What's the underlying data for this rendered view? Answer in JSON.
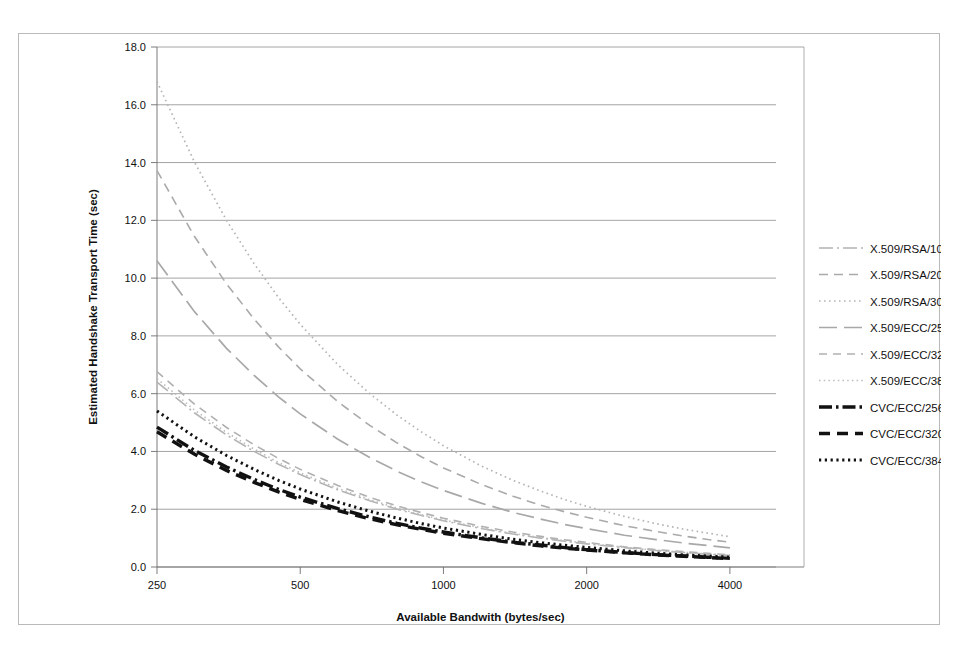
{
  "figure": {
    "background": "#ffffff",
    "border_color": "#b9b9b9"
  },
  "chart_data": {
    "type": "line",
    "title": "",
    "xlabel": "Available Bandwith (bytes/sec)",
    "ylabel": "Estimated Handshake Transport Time (sec)",
    "x_scale": "log",
    "x_tick_labels": [
      "250",
      "500",
      "1000",
      "2000",
      "4000"
    ],
    "x_tick_values": [
      250,
      500,
      1000,
      2000,
      4000
    ],
    "xlim": [
      250,
      5000
    ],
    "y_tick_labels": [
      "0.0",
      "2.0",
      "4.0",
      "6.0",
      "8.0",
      "10.0",
      "12.0",
      "14.0",
      "16.0",
      "18.0"
    ],
    "y_tick_values": [
      0.0,
      2.0,
      4.0,
      6.0,
      8.0,
      10.0,
      12.0,
      14.0,
      16.0,
      18.0
    ],
    "ylim": [
      0,
      18
    ],
    "grid": true,
    "grid_axis": "y",
    "legend_position": "right",
    "x": [
      250,
      300,
      350,
      400,
      450,
      500,
      600,
      700,
      800,
      900,
      1000,
      1200,
      1400,
      1600,
      1800,
      2000,
      2400,
      2800,
      3200,
      3600,
      4000
    ],
    "series": [
      {
        "name": "X.509/RSA/1024",
        "color": "#b3b3b3",
        "dash": "14,4,2,4",
        "width": 1.6,
        "values": [
          6.4,
          5.33,
          4.57,
          4.0,
          3.56,
          3.2,
          2.67,
          2.29,
          2.0,
          1.78,
          1.6,
          1.33,
          1.14,
          1.0,
          0.89,
          0.8,
          0.67,
          0.57,
          0.5,
          0.44,
          0.4
        ]
      },
      {
        "name": "X.509/RSA/2048",
        "color": "#aaaaaa",
        "dash": "9,6",
        "width": 1.6,
        "values": [
          13.72,
          11.43,
          9.8,
          8.58,
          7.62,
          6.86,
          5.72,
          4.9,
          4.29,
          3.81,
          3.43,
          2.86,
          2.45,
          2.14,
          1.91,
          1.72,
          1.43,
          1.23,
          1.07,
          0.95,
          0.86
        ]
      },
      {
        "name": "X.509/RSA/3072",
        "color": "#b5b5b5",
        "dash": "1.6,3.4",
        "width": 1.7,
        "values": [
          16.8,
          14.0,
          12.0,
          10.5,
          9.33,
          8.4,
          7.0,
          6.0,
          5.25,
          4.67,
          4.2,
          3.5,
          3.0,
          2.63,
          2.33,
          2.1,
          1.75,
          1.5,
          1.31,
          1.17,
          1.05
        ]
      },
      {
        "name": "X.509/ECC/256",
        "color": "#a8a8a8",
        "dash": "18,7",
        "width": 1.7,
        "values": [
          10.6,
          8.83,
          7.57,
          6.63,
          5.89,
          5.3,
          4.42,
          3.79,
          3.31,
          2.94,
          2.65,
          2.21,
          1.89,
          1.66,
          1.47,
          1.33,
          1.1,
          0.95,
          0.83,
          0.74,
          0.66
        ]
      },
      {
        "name": "X.509/ECC/320",
        "color": "#b0b0b0",
        "dash": "8,6",
        "width": 1.6,
        "values": [
          6.76,
          5.63,
          4.83,
          4.23,
          3.76,
          3.38,
          2.82,
          2.41,
          2.11,
          1.88,
          1.69,
          1.41,
          1.21,
          1.06,
          0.94,
          0.85,
          0.7,
          0.6,
          0.53,
          0.47,
          0.42
        ]
      },
      {
        "name": "X.509/ECC/384",
        "color": "#bcbcbc",
        "dash": "1.5,3.2",
        "width": 1.6,
        "values": [
          6.52,
          5.43,
          4.66,
          4.08,
          3.62,
          3.26,
          2.72,
          2.33,
          2.04,
          1.81,
          1.63,
          1.36,
          1.16,
          1.02,
          0.91,
          0.82,
          0.68,
          0.58,
          0.51,
          0.45,
          0.41
        ]
      },
      {
        "name": "CVC/ECC/256",
        "color": "#111111",
        "dash": "13,4,2.5,4",
        "width": 3.4,
        "values": [
          4.84,
          4.03,
          3.46,
          3.03,
          2.69,
          2.42,
          2.02,
          1.73,
          1.51,
          1.34,
          1.21,
          1.01,
          0.86,
          0.76,
          0.67,
          0.6,
          0.5,
          0.43,
          0.38,
          0.34,
          0.3
        ]
      },
      {
        "name": "CVC/ECC/320",
        "color": "#111111",
        "dash": "11,7",
        "width": 3.4,
        "values": [
          4.68,
          3.9,
          3.34,
          2.93,
          2.6,
          2.34,
          1.95,
          1.67,
          1.46,
          1.3,
          1.17,
          0.98,
          0.84,
          0.73,
          0.65,
          0.59,
          0.49,
          0.42,
          0.37,
          0.33,
          0.29
        ]
      },
      {
        "name": "CVC/ECC/384",
        "color": "#111111",
        "dash": "2.2,3.6",
        "width": 3.0,
        "values": [
          5.4,
          4.5,
          3.86,
          3.38,
          3.0,
          2.7,
          2.25,
          1.93,
          1.69,
          1.5,
          1.35,
          1.13,
          0.96,
          0.84,
          0.75,
          0.68,
          0.56,
          0.48,
          0.42,
          0.38,
          0.34
        ]
      }
    ]
  }
}
